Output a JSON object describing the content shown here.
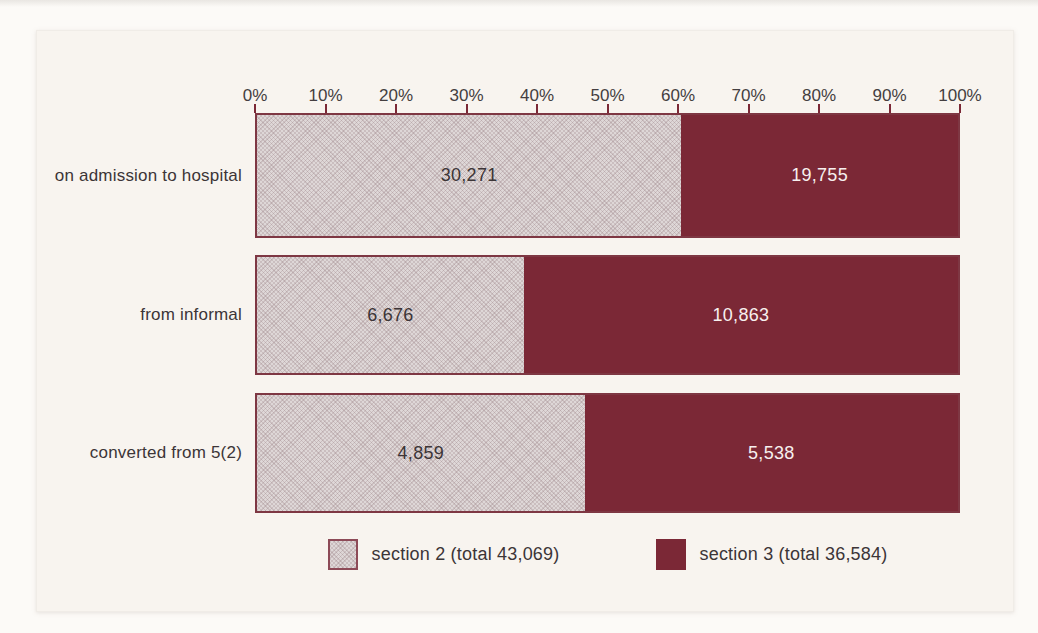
{
  "figure": {
    "background": "#fcfaf7",
    "panel_background": "#f8f4ef"
  },
  "chart_data": {
    "type": "bar",
    "orientation": "horizontal",
    "stacked": true,
    "title": "",
    "xlabel": "",
    "ylabel": "",
    "x_axis": {
      "min": 0,
      "max": 100,
      "unit": "percent",
      "tick_labels": [
        "0%",
        "10%",
        "20%",
        "30%",
        "40%",
        "50%",
        "60%",
        "70%",
        "80%",
        "90%",
        "100%"
      ]
    },
    "categories": [
      "on admission to hospital",
      "from informal",
      "converted from 5(2)"
    ],
    "series": [
      {
        "name": "section 2",
        "legend_label": "section 2 (total 43,069)",
        "total_label": "43,069",
        "fill": "#ded7d7",
        "values": [
          30271,
          6676,
          4859
        ],
        "value_labels": [
          "30,271",
          "6,676",
          "4,859"
        ]
      },
      {
        "name": "section 3",
        "legend_label": "section 3 (total 36,584)",
        "total_label": "36,584",
        "fill": "#7b2836",
        "values": [
          19755,
          10863,
          5538
        ],
        "value_labels": [
          "19,755",
          "10,863",
          "5,538"
        ]
      }
    ],
    "row_percent_section2": [
      60.5,
      38.1,
      46.7
    ],
    "legend_position": "bottom"
  },
  "colors": {
    "section2_fill": "#ded7d7",
    "section3_fill": "#7b2836",
    "bar_border": "#7e3743",
    "tick": "#7b2836",
    "axis_text": "#443e40",
    "label_text": "#3c3537",
    "value_text_on_dark": "#f7f0ef"
  }
}
